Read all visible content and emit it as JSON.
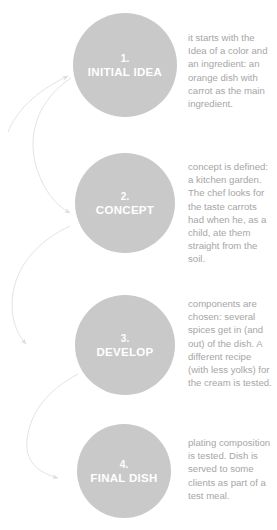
{
  "diagram": {
    "circle_color": "#c9c9c9",
    "label_color": "#ffffff",
    "text_color": "#a6a6a6",
    "arrow_color": "#e2e2e2",
    "stages": [
      {
        "number": "1.",
        "label": "INITIAL IDEA",
        "description": "it starts with the Idea of a color and an ingredient: an orange dish with carrot as the main ingredient."
      },
      {
        "number": "2.",
        "label": "CONCEPT",
        "description": "concept is defined: a kitchen garden. The chef looks for the taste carrots had when he, as a child, ate them straight from the soil."
      },
      {
        "number": "3.",
        "label": "DEVELOP",
        "description": "components are chosen: several spices get in (and out) of the dish. A different recipe (with less yolks) for the cream is tested."
      },
      {
        "number": "4.",
        "label": "FINAL DISH",
        "description": "plating composition is tested. Dish is served to some clients as part of a test meal."
      }
    ]
  }
}
